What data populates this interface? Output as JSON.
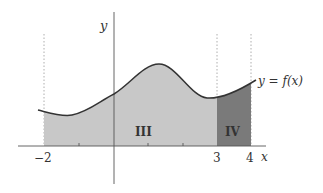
{
  "diagram": {
    "title": "",
    "axis_labels": {
      "x": "x",
      "y": "y"
    },
    "curve_label": "y = f(x)",
    "tick_labels": [
      "−2",
      "3",
      "4"
    ],
    "regions": [
      {
        "name": "III",
        "from": -2,
        "to": 3,
        "color": "#c8c8c8"
      },
      {
        "name": "IV",
        "from": 3,
        "to": 4,
        "color": "#7a7a7a"
      }
    ],
    "colors": {
      "curve": "#333333",
      "axis": "#555555",
      "light_fill": "#c8c8c8",
      "dark_fill": "#7a7a7a"
    }
  }
}
